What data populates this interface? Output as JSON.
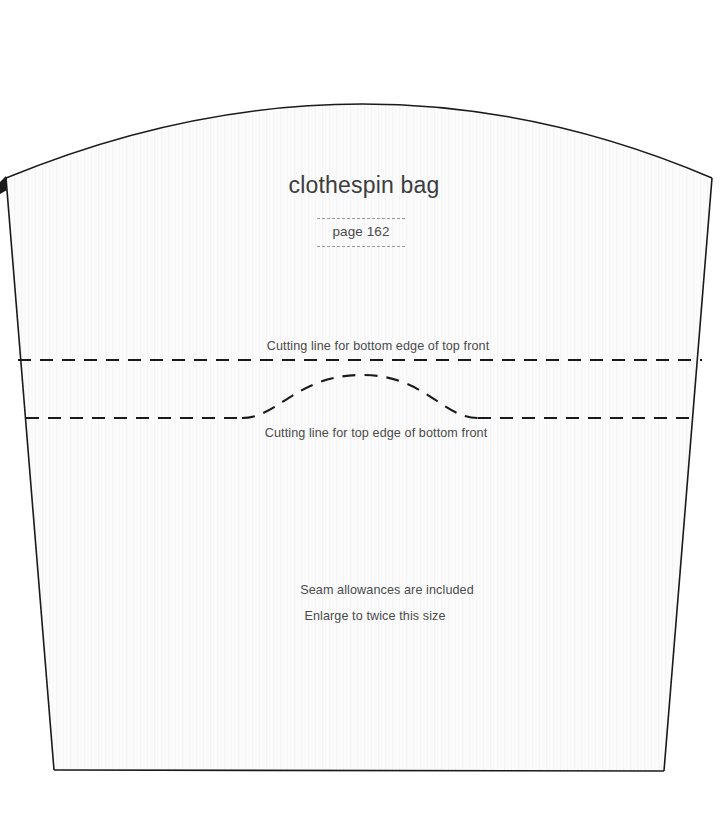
{
  "document": {
    "type": "sewing-pattern-sheet",
    "title": "clothespin bag",
    "page_reference": "page 162"
  },
  "labels": {
    "cutting_line_top_front": "Cutting line for bottom edge of top front",
    "cutting_line_bottom_front": "Cutting line for top edge of bottom front",
    "seam_allowance_note": "Seam allowances are included",
    "enlarge_note": "Enlarge to twice this size"
  },
  "colors": {
    "outline": "#1a1a1a",
    "dashed_line": "#1a1a1a",
    "deco_dash": "#9a9a9a",
    "text": "#4a4a4a",
    "title_text": "#3d3d3d",
    "paper_fill": "#fcfcfc",
    "background": "#ffffff"
  },
  "geometry": {
    "canvas": {
      "width": 728,
      "height": 839
    },
    "outline_points": {
      "top_left": [
        6,
        178
      ],
      "arc_apex": [
        365,
        70
      ],
      "top_right": [
        712,
        178
      ],
      "bottom_right": [
        664,
        771
      ],
      "bottom_left": [
        54,
        770
      ]
    },
    "cutting_line_upper": {
      "y": 360,
      "x_start": 18,
      "x_end": 702
    },
    "cutting_line_lower": {
      "y": 418,
      "x_start": 26,
      "x_end": 692
    },
    "curved_cutout": {
      "x_start": 242,
      "x_end": 478,
      "apex_y": 375,
      "base_y": 418
    }
  }
}
